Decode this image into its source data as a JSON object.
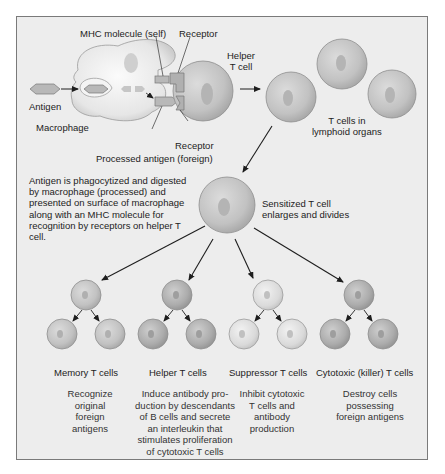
{
  "figure": {
    "top_labels": {
      "mhc_molecule": "MHC molecule (self)",
      "receptor_top": "Receptor",
      "helper_t_cell": "Helper\nT cell",
      "antigen": "Antigen",
      "macrophage": "Macrophage",
      "receptor_bottom": "Receptor",
      "processed_antigen": "Processed antigen (foreign)",
      "t_cells_lymphoid": "T cells in\nlymphoid organs"
    },
    "explanation": "Antigen is phagocytized and digested by macrophage (processed) and presented on surface of macrophage along with an MHC molecule for recognition by receptors on helper T cell.",
    "sensitized": "Sensitized T cell\nenlarges and divides",
    "branches": [
      {
        "name": "Memory T cells",
        "description": "Recognize\noriginal\nforeign\nantigens",
        "shade": "#c9c9c9"
      },
      {
        "name": "Helper T cells",
        "description": "Induce antibody pro-\nduction by descendants\nof B cells and secrete\nan interleukin that\nstimulates proliferation\nof cytotoxic T cells",
        "shade": "#b2b2b2"
      },
      {
        "name": "Suppressor T cells",
        "description": "Inhibit cytotoxic\nT cells and\nantibody\nproduction",
        "shade": "#dedede"
      },
      {
        "name": "Cytotoxic (killer) T cells",
        "description": "Destroy cells\npossessing\nforeign antigens",
        "shade": "#b5b5b5"
      }
    ],
    "colors": {
      "background": "#ededed",
      "frame_border": "#7a7a7a",
      "cell_fill": "#c4c4c4",
      "cell_edge": "#8e8e8e",
      "arrow": "#1e1e1e"
    }
  }
}
